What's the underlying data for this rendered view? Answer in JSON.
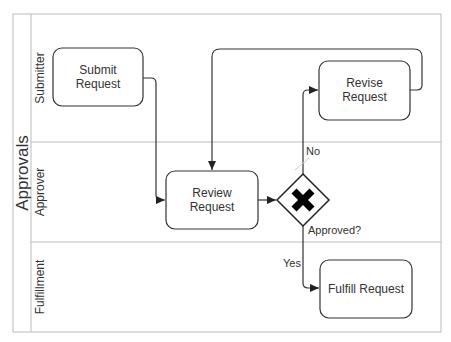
{
  "pool": {
    "title": "Approvals"
  },
  "lanes": [
    {
      "id": "submitter",
      "label": "Submitter"
    },
    {
      "id": "approver",
      "label": "Approver"
    },
    {
      "id": "fulfillment",
      "label": "Fulfillment"
    }
  ],
  "tasks": {
    "submit": {
      "line1": "Submit",
      "line2": "Request"
    },
    "revise": {
      "line1": "Revise",
      "line2": "Request"
    },
    "review": {
      "line1": "Review",
      "line2": "Request"
    },
    "fulfill": {
      "line1": "Fulfill Request"
    }
  },
  "gateway": {
    "type": "exclusive",
    "icon": "x-icon",
    "label": "Approved?"
  },
  "flows": {
    "no_label": "No",
    "yes_label": "Yes"
  },
  "colors": {
    "stroke": "#333333",
    "lane_line": "#bbbbbb",
    "text": "#333333"
  }
}
